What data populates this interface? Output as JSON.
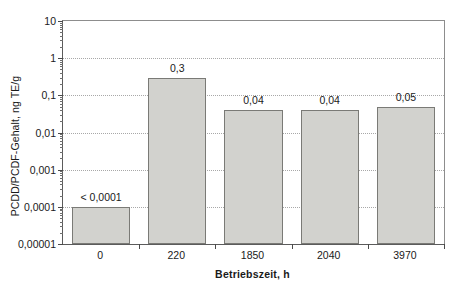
{
  "chart_data": {
    "type": "bar",
    "title": "",
    "subtitle": "",
    "xlabel": "Betriebszeit, h",
    "ylabel": "PCDD/PCDF-Gehalt, ng TE/g",
    "yscale": "log",
    "ylim": [
      1e-05,
      10
    ],
    "grid": true,
    "legend": false,
    "legend_position": "none",
    "categories": [
      "0",
      "220",
      "1850",
      "2040",
      "3970"
    ],
    "values": [
      0.0001,
      0.3,
      0.04,
      0.04,
      0.05
    ],
    "data_labels": [
      "< 0,0001",
      "0,3",
      "0,04",
      "0,04",
      "0,05"
    ],
    "ytick_labels": [
      "10",
      "1",
      "0,1",
      "0,01",
      "0,001",
      "0,0001",
      "0,00001"
    ],
    "ytick_values": [
      10,
      1,
      0.1,
      0.01,
      0.001,
      0.0001,
      1e-05
    ],
    "series": [
      {
        "name": "PCDD/PCDF-Gehalt",
        "values": [
          0.0001,
          0.3,
          0.04,
          0.04,
          0.05
        ]
      }
    ],
    "bar_fill_color": "#d2d2ce",
    "bar_border_color": "#7a7a76",
    "gridline_color": "#a8a8a8",
    "axis_color": "#5b5b5b",
    "background_color": "#ffffff"
  }
}
